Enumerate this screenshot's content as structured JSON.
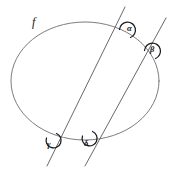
{
  "figure": {
    "background_color": "#ffffff",
    "curve_color": "#6d6d72",
    "line_color": "#5f5f66",
    "arc_color": "#1b1b1f",
    "label_color": "#141418",
    "width": 169,
    "height": 169
  },
  "curve": {
    "name": "f",
    "type": "ellipse",
    "center_x": 85,
    "center_y": 81,
    "radius_x": 74,
    "radius_y": 59
  },
  "lines": [
    {
      "name": "line-1",
      "x1": 125,
      "y1": 7,
      "x2": 47,
      "y2": 166
    },
    {
      "name": "line-2",
      "x1": 166,
      "y1": 18,
      "x2": 85,
      "y2": 166
    }
  ],
  "angles": [
    {
      "name": "alpha",
      "label": "α",
      "vertex_x": 126,
      "vertex_y": 31,
      "label_x": 127,
      "label_y": 24
    },
    {
      "name": "beta",
      "label": "β",
      "vertex_x": 151,
      "vertex_y": 52,
      "label_x": 150,
      "label_y": 45
    },
    {
      "name": "gamma",
      "label": "γ",
      "vertex_x": 53,
      "vertex_y": 139,
      "label_x": 47,
      "label_y": 140
    },
    {
      "name": "delta",
      "label": "δ",
      "vertex_x": 89,
      "vertex_y": 137,
      "label_x": 84,
      "label_y": 139
    }
  ]
}
